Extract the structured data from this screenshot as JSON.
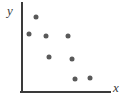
{
  "chart_data": {
    "type": "scatter",
    "title": "",
    "subtitle": "",
    "xlabel": "x",
    "ylabel": "y",
    "grid": false,
    "legend": null,
    "xlim": [
      0,
      10
    ],
    "ylim": [
      0,
      10
    ],
    "marker": {
      "shape": "circle",
      "color": "#595959",
      "size_px": 5
    },
    "axis": {
      "color": "#3a3a3a",
      "width_px": 2,
      "x_axis": {
        "x_start_px": 22,
        "x_end_px": 110,
        "y_px": 92
      },
      "y_axis": {
        "y_start_px": 3,
        "y_end_px": 92,
        "x_px": 22
      }
    },
    "series": [
      {
        "name": "points",
        "points": [
          {
            "x": 1.6,
            "y": 8.4,
            "px": 36,
            "py": 17
          },
          {
            "x": 0.8,
            "y": 6.5,
            "px": 29,
            "py": 34
          },
          {
            "x": 2.7,
            "y": 6.3,
            "px": 46,
            "py": 36
          },
          {
            "x": 5.2,
            "y": 6.3,
            "px": 68,
            "py": 36
          },
          {
            "x": 3.1,
            "y": 3.9,
            "px": 49,
            "py": 57
          },
          {
            "x": 5.7,
            "y": 3.7,
            "px": 72,
            "py": 59
          },
          {
            "x": 6.0,
            "y": 1.5,
            "px": 75,
            "py": 79
          },
          {
            "x": 7.7,
            "y": 1.6,
            "px": 90,
            "py": 78
          }
        ]
      }
    ],
    "point_count": 8
  },
  "labels": {
    "y": "y",
    "x": "x"
  },
  "colors": {
    "marker": "#595959",
    "axis": "#3a3a3a",
    "background": "#ffffff"
  }
}
